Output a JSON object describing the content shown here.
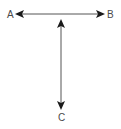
{
  "diagram": {
    "labels": {
      "a": "A",
      "b": "B",
      "c": "C"
    },
    "arrows": [
      {
        "name": "arrow-a-b",
        "from": "A",
        "to": "B",
        "bidirectional": true,
        "orientation": "horizontal"
      },
      {
        "name": "arrow-c",
        "from": "top",
        "to": "C",
        "bidirectional": true,
        "orientation": "vertical"
      }
    ],
    "colors": {
      "line": "#555555",
      "arrowhead": "#1a1a1a",
      "text": "#4a4a4a",
      "background": "#ffffff"
    }
  }
}
